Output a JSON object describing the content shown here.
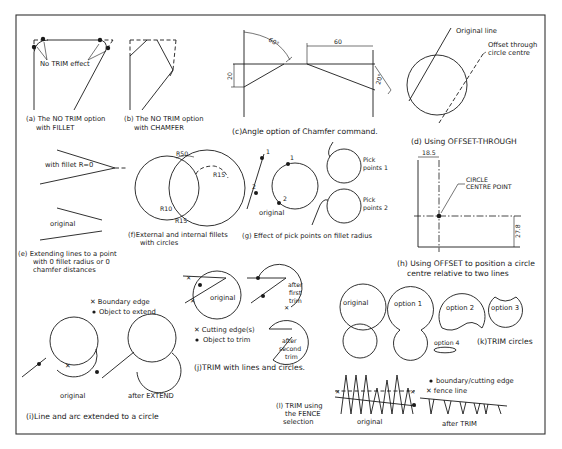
{
  "figure": {
    "frame": {
      "x": 16,
      "y": 15,
      "width": 529,
      "height": 419,
      "color": "#333333"
    },
    "ink_color": "#1a1a1a",
    "panels": {
      "a": {
        "caption_line1": "(a) The NO TRIM option",
        "caption_line2": "with FILLET",
        "annotation": "No TRIM effect"
      },
      "b": {
        "caption_line1": "(b) The NO TRIM option",
        "caption_line2": "with CHAMFER"
      },
      "c": {
        "caption": "(c)Angle option of Chamfer command.",
        "angle_label": "60°",
        "length_label": "60",
        "height_label": "20",
        "angle_label_right": "20°"
      },
      "d": {
        "caption": "(d) Using OFFSET-THROUGH",
        "original_line_label": "Original line",
        "offset_label_line1": "Offset through",
        "offset_label_line2": "circle centre"
      },
      "e": {
        "fillet_label": "with fillet R=0",
        "original_label": "original",
        "caption_line1": "(e) Extending lines to a point",
        "caption_line2": "with 0 fillet radius or 0",
        "caption_line3": "chamfer distances"
      },
      "f": {
        "r50": "R50",
        "r15_top": "R15",
        "r10": "R10",
        "r15_bottom": "R15",
        "caption_line1": "(f)External and internal fillets",
        "caption_line2": "with circles"
      },
      "g": {
        "point1": "1",
        "point2": "2",
        "point1b": "1",
        "point2b": "2",
        "original_label": "original",
        "pick1_line1": "Pick",
        "pick1_line2": "points 1",
        "pick2_line1": "Pick",
        "pick2_line2": "points 2",
        "caption": "(g) Effect of pick points on fillet radius"
      },
      "h": {
        "dim_x": "18.5",
        "dim_y": "27.8",
        "centre_label_line1": "CIRCLE",
        "centre_label_line2": "CENTRE POINT",
        "caption_line1": "(h) Using OFFSET to position a circle",
        "caption_line2": "centre relative to two lines"
      },
      "i": {
        "legend_boundary": "Boundary edge",
        "legend_object": "Object to extend",
        "original_label": "original",
        "after_label": "after EXTEND",
        "caption": "(i)Line and arc extended to a circle"
      },
      "j": {
        "original_label": "original",
        "after_first_line1": "after",
        "after_first_line2": "first",
        "after_first_line3": "trim",
        "after_second_line1": "after",
        "after_second_line2": "second",
        "after_second_line3": "trim",
        "legend_cutting": "Cutting edge(s)",
        "legend_object": "Object to trim",
        "caption": "(j)TRIM with lines and circles."
      },
      "k": {
        "original_label": "original",
        "option1": "option 1",
        "option2": "option 2",
        "option3": "option 3",
        "option4": "option 4",
        "caption": "(k)TRIM circles"
      },
      "l": {
        "caption_line1": "(l) TRIM using",
        "caption_line2": "the FENCE",
        "caption_line3": "selection",
        "legend_boundary": "boundary/cutting edge",
        "legend_fence": "fence line",
        "original_label": "original",
        "after_label": "after TRIM"
      }
    }
  }
}
